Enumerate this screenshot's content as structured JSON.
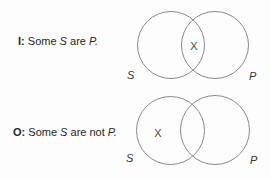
{
  "colors": {
    "background": "#fdfdfd",
    "circle_stroke": "#8a8a8a",
    "statement_text": "#262626",
    "x_mark": "#4a4a4a"
  },
  "statements": {
    "i": {
      "label": "I:",
      "word1": "Some",
      "subject": "S",
      "word2": "are",
      "predicate": "P."
    },
    "o": {
      "label": "O:",
      "word1": "Some",
      "subject": "S",
      "word2": "are not",
      "predicate": "P."
    }
  },
  "diagrams": {
    "i": {
      "x_mark": "X",
      "left_circle_label": "S",
      "right_circle_label": "P"
    },
    "o": {
      "x_mark": "X",
      "left_circle_label": "S",
      "right_circle_label": "P"
    }
  }
}
